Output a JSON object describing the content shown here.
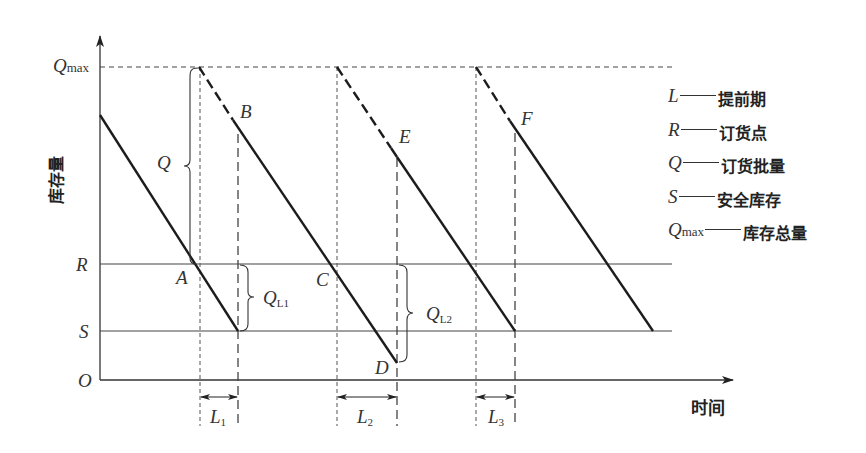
{
  "diagram": {
    "title": "",
    "y_axis_label": "库存量",
    "x_axis_label": "时间",
    "origin_label": "O",
    "level_labels": {
      "qmax": {
        "symbol": "Q",
        "sub": "max"
      },
      "r": "R",
      "s": "S"
    },
    "point_labels": {
      "a": "A",
      "b": "B",
      "c": "C",
      "d": "D",
      "e": "E",
      "f": "F"
    },
    "brace_labels": {
      "q": "Q",
      "ql1": {
        "symbol": "Q",
        "sub": "L1"
      },
      "ql2": {
        "symbol": "Q",
        "sub": "L2"
      }
    },
    "lead_time_labels": [
      {
        "symbol": "L",
        "sub": "1"
      },
      {
        "symbol": "L",
        "sub": "2"
      },
      {
        "symbol": "L",
        "sub": "3"
      }
    ],
    "legend": [
      {
        "symbol": "L",
        "sub": "",
        "text": "提前期"
      },
      {
        "symbol": "R",
        "sub": "",
        "text": "订货点"
      },
      {
        "symbol": "Q",
        "sub": "",
        "text": "订货批量"
      },
      {
        "symbol": "S",
        "sub": "",
        "text": "安全库存"
      },
      {
        "symbol": "Q",
        "sub": "max",
        "text": "库存总量"
      }
    ],
    "colors": {
      "line": "#222222",
      "grid": "#444444",
      "background": "#ffffff"
    }
  }
}
